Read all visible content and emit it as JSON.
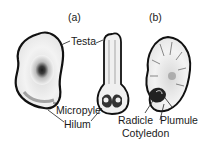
{
  "figure": {
    "panels": [
      {
        "id": "a",
        "label": "(a)"
      },
      {
        "id": "b",
        "label": "(b)"
      }
    ],
    "labels": {
      "testa": "Testa",
      "micropyle": "Micropyle",
      "hilum": "Hilum",
      "radicle": "Radicle",
      "plumule": "Plumule",
      "cotyledon": "Cotyledon"
    },
    "colors": {
      "ink": "#1a1a1a",
      "background": "#ffffff"
    }
  }
}
